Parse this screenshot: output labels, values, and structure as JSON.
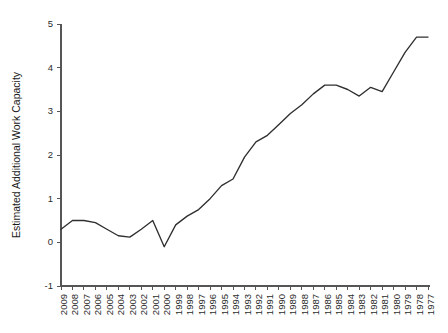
{
  "chart_data": {
    "type": "line",
    "title": "",
    "xlabel": "",
    "ylabel": "Estimated Additional Work Capacity",
    "ylim": [
      -1,
      5
    ],
    "yticks": [
      -1,
      0,
      1,
      2,
      3,
      4,
      5
    ],
    "ytick_labels": [
      "-1",
      "0",
      "1",
      "2",
      "3",
      "4",
      "5"
    ],
    "grid": false,
    "legend": "none",
    "x_axis_direction": "descending",
    "categories": [
      "2009",
      "2008",
      "2007",
      "2006",
      "2005",
      "2004",
      "2003",
      "2002",
      "2001",
      "2000",
      "1999",
      "1998",
      "1997",
      "1996",
      "1995",
      "1994",
      "1993",
      "1992",
      "1991",
      "1990",
      "1989",
      "1988",
      "1987",
      "1986",
      "1985",
      "1984",
      "1983",
      "1982",
      "1981",
      "1980",
      "1979",
      "1978",
      "1977"
    ],
    "values": [
      0.3,
      0.5,
      0.5,
      0.45,
      0.3,
      0.15,
      0.12,
      0.3,
      0.5,
      -0.1,
      0.4,
      0.6,
      0.75,
      1.0,
      1.3,
      1.45,
      1.95,
      2.3,
      2.45,
      2.7,
      2.95,
      3.15,
      3.4,
      3.6,
      3.6,
      3.5,
      3.35,
      3.55,
      3.45,
      3.9,
      4.35,
      4.7,
      4.7
    ]
  },
  "caption": {
    "text": ""
  }
}
